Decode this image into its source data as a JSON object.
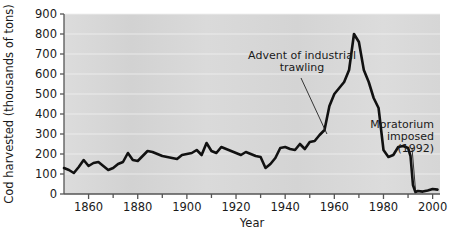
{
  "chart_data": {
    "type": "line",
    "title": "",
    "xlabel": "Year",
    "ylabel": "Cod harvested (thousands of tons)",
    "xlim": [
      1850,
      2003
    ],
    "ylim": [
      0,
      900
    ],
    "grid": true,
    "legend": "none",
    "y_ticks": [
      0,
      100,
      200,
      300,
      400,
      500,
      600,
      700,
      800,
      900
    ],
    "y_tick_labels": [
      "0",
      "100",
      "200",
      "300",
      "400",
      "500",
      "600",
      "700",
      "800",
      "900"
    ],
    "x_ticks": [
      1860,
      1870,
      1880,
      1890,
      1900,
      1910,
      1920,
      1930,
      1940,
      1950,
      1960,
      1970,
      1980,
      1990,
      2000
    ],
    "x_tick_labels_major": [
      "1860",
      "1880",
      "1900",
      "1920",
      "1940",
      "1960",
      "1980",
      "2000"
    ],
    "x_major_ticks": [
      1860,
      1880,
      1900,
      1920,
      1940,
      1960,
      1980,
      2000
    ],
    "series": [
      {
        "name": "Cod harvest",
        "color": "#111111",
        "x": [
          1850,
          1852,
          1854,
          1856,
          1858,
          1860,
          1862,
          1864,
          1866,
          1868,
          1870,
          1872,
          1874,
          1876,
          1878,
          1880,
          1882,
          1884,
          1886,
          1888,
          1890,
          1892,
          1894,
          1896,
          1898,
          1900,
          1902,
          1904,
          1906,
          1908,
          1910,
          1912,
          1914,
          1916,
          1918,
          1920,
          1922,
          1924,
          1926,
          1928,
          1930,
          1932,
          1934,
          1936,
          1938,
          1940,
          1942,
          1944,
          1946,
          1948,
          1950,
          1952,
          1954,
          1956,
          1958,
          1960,
          1962,
          1964,
          1966,
          1968,
          1970,
          1972,
          1974,
          1976,
          1978,
          1980,
          1982,
          1984,
          1986,
          1988,
          1990,
          1991,
          1992,
          1993,
          1994,
          1996,
          1998,
          2000,
          2002
        ],
        "y": [
          130,
          120,
          105,
          135,
          170,
          140,
          155,
          160,
          140,
          120,
          130,
          150,
          160,
          205,
          170,
          165,
          190,
          215,
          210,
          200,
          190,
          185,
          180,
          175,
          195,
          200,
          205,
          220,
          195,
          255,
          215,
          205,
          235,
          225,
          215,
          205,
          195,
          210,
          200,
          190,
          185,
          130,
          150,
          180,
          230,
          235,
          225,
          220,
          250,
          225,
          260,
          265,
          295,
          320,
          440,
          500,
          530,
          560,
          620,
          800,
          760,
          620,
          560,
          480,
          430,
          220,
          185,
          195,
          235,
          240,
          230,
          190,
          45,
          10,
          15,
          12,
          18,
          25,
          22
        ]
      }
    ],
    "annotations": [
      {
        "label_lines": [
          "Advent of industrial",
          "trawling"
        ],
        "point_year": 1957,
        "point_value": 300
      },
      {
        "label_lines": [
          "Moratorium",
          "imposed",
          "(1992)"
        ],
        "point_year": 1993,
        "point_value": 25
      }
    ],
    "style": {
      "plot_background": "#d8d8d8",
      "gridline_color": "#f0f0f0",
      "axis_color": "#555555",
      "line_color": "#111111",
      "page_background": "#ffffff"
    }
  }
}
